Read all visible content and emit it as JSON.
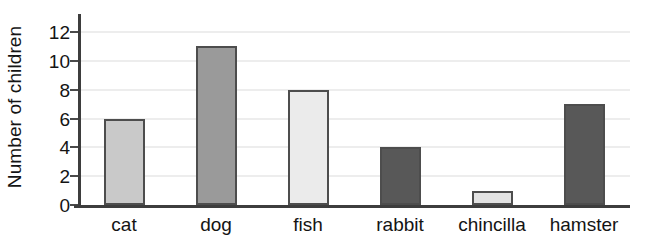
{
  "chart_data": {
    "type": "bar",
    "title": "",
    "xlabel": "",
    "ylabel": "Number of children",
    "categories": [
      "cat",
      "dog",
      "fish",
      "rabbit",
      "chincilla",
      "hamster"
    ],
    "values": [
      6,
      11,
      8,
      4,
      1,
      7
    ],
    "bar_colors": [
      "#c9c9c9",
      "#9a9a9a",
      "#ebebeb",
      "#585858",
      "#e2e2e2",
      "#585858"
    ],
    "bar_border_color": "#4d4d4d",
    "ylim": [
      0,
      12
    ],
    "ytick_labels": [
      "0",
      "2",
      "4",
      "6",
      "8",
      "10",
      "12"
    ],
    "ytick_values": [
      0,
      2,
      4,
      6,
      8,
      10,
      12
    ],
    "grid": true,
    "gridline_color": "#dcdcdc",
    "axis_color": "#3d3d3d",
    "legend": null,
    "background": "#ffffff"
  }
}
